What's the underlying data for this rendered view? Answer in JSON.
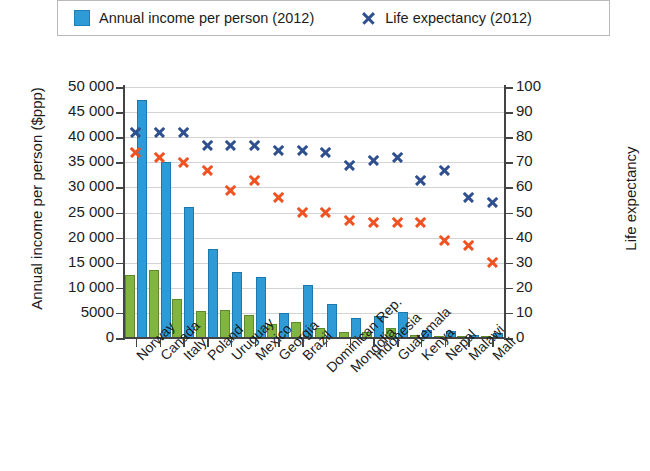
{
  "legend": {
    "items": [
      {
        "label": "Annual income per person (2012)",
        "marker": "square-swatch-icon",
        "color": "#2e9bd6"
      },
      {
        "label": "Life expectancy (2012)",
        "marker": "x-marker-icon",
        "color": "#2f4f8f"
      }
    ]
  },
  "axes": {
    "left_title": "Annual income per person ($ppp)",
    "right_title": "Life expectancy",
    "left_ticks": [
      "50 000",
      "45 000",
      "40 000",
      "35 000",
      "30 000",
      "25 000",
      "20 000",
      "15 000",
      "10 000",
      "5000",
      "0"
    ],
    "right_ticks": [
      "100",
      "90",
      "80",
      "70",
      "60",
      "50",
      "40",
      "30",
      "20",
      "10",
      "0"
    ]
  },
  "chart_data": {
    "type": "bar",
    "title": "",
    "xlabel": "",
    "ylabel": "Annual income per person ($ppp)",
    "y2label": "Life expectancy",
    "ylim": [
      0,
      50000
    ],
    "y2lim": [
      0,
      100
    ],
    "grid": true,
    "legend_position": "top",
    "categories": [
      "Norway",
      "Canada",
      "Italy",
      "Poland",
      "Uruguay",
      "Mexico",
      "Georgia",
      "Brazil",
      "Dominican Rep.",
      "Mongolia",
      "Indonesia",
      "Guatemala",
      "Kenya",
      "Nepal",
      "Malawi",
      "Mali"
    ],
    "series": [
      {
        "name": "Annual income per person (2012)",
        "axis": "left",
        "type": "bar",
        "color": "#2e9bd6",
        "values": [
          47500,
          35000,
          26000,
          17800,
          13200,
          12100,
          5000,
          10500,
          6700,
          4000,
          4300,
          5100,
          1500,
          1300,
          700,
          1000
        ]
      },
      {
        "name": "Green bar series",
        "axis": "left",
        "type": "bar",
        "color": "#81b441",
        "values": [
          12500,
          13600,
          7700,
          5300,
          5500,
          4600,
          2700,
          3100,
          1900,
          1100,
          1200,
          2000,
          700,
          500,
          350,
          400
        ]
      },
      {
        "name": "Life expectancy (2012)",
        "axis": "right",
        "type": "scatter",
        "color": "#2f4f8f",
        "values": [
          82,
          82,
          82,
          77,
          77,
          77,
          75,
          75,
          74,
          69,
          71,
          72,
          63,
          67,
          56,
          54
        ]
      },
      {
        "name": "Red marker series",
        "axis": "right",
        "type": "scatter",
        "color": "#ef5223",
        "values": [
          74,
          72,
          70,
          67,
          59,
          63,
          56,
          50,
          50,
          47,
          46,
          46,
          46,
          39,
          37,
          30
        ]
      }
    ]
  }
}
